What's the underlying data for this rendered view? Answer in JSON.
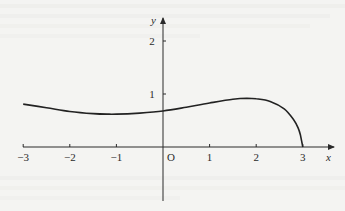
{
  "chart_data": {
    "type": "line",
    "title": "",
    "xlabel": "x",
    "ylabel": "y",
    "origin_label": "O",
    "x_ticks": [
      -3,
      -2,
      -1,
      1,
      2,
      3
    ],
    "x_tick_labels": [
      "−3",
      "−2",
      "−1",
      "1",
      "2",
      "3"
    ],
    "y_ticks": [
      1,
      2
    ],
    "y_tick_labels": [
      "1",
      "2"
    ],
    "xlim": [
      -3,
      3.6
    ],
    "ylim": [
      -1,
      2.5
    ],
    "grid": false,
    "legend": null,
    "series": [
      {
        "name": "curve",
        "x": [
          -3,
          -2.5,
          -2,
          -1.5,
          -1.2,
          -1,
          -0.5,
          0,
          0.5,
          1,
          1.5,
          1.8,
          2,
          2.3,
          2.6,
          2.8,
          2.9,
          2.95,
          3
        ],
        "y": [
          0.81,
          0.74,
          0.67,
          0.63,
          0.62,
          0.62,
          0.64,
          0.68,
          0.75,
          0.83,
          0.9,
          0.92,
          0.91,
          0.86,
          0.72,
          0.52,
          0.36,
          0.22,
          0
        ]
      }
    ],
    "annotations": []
  }
}
